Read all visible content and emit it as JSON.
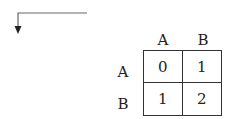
{
  "arrow": {
    "direction": "left-then-down",
    "color": "#555555"
  },
  "matrix": {
    "column_headers": [
      "A",
      "B"
    ],
    "row_headers": [
      "A",
      "B"
    ],
    "rows": [
      [
        "0",
        "1"
      ],
      [
        "1",
        "2"
      ]
    ]
  }
}
